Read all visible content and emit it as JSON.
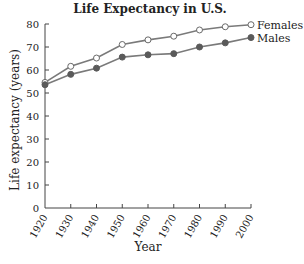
{
  "chart_data": {
    "type": "line",
    "title": "Life Expectancy in U.S.",
    "xlabel": "Year",
    "ylabel": "Life expectancy (years)",
    "x": [
      1920,
      1930,
      1940,
      1950,
      1960,
      1970,
      1980,
      1990,
      2000
    ],
    "series": [
      {
        "name": "Females",
        "marker": "hollow-circle",
        "values": [
          54.6,
          61.6,
          65.2,
          71.1,
          73.1,
          74.7,
          77.4,
          78.8,
          79.7
        ]
      },
      {
        "name": "Males",
        "marker": "filled-circle",
        "values": [
          53.6,
          58.1,
          60.8,
          65.6,
          66.6,
          67.1,
          70.0,
          71.8,
          74.1
        ]
      }
    ],
    "xlim": [
      1920,
      2000
    ],
    "ylim": [
      0,
      80
    ],
    "xticks": [
      "1920",
      "1930",
      "1940",
      "1950",
      "1960",
      "1970",
      "1980",
      "1990",
      "2000"
    ],
    "yticks": [
      "0",
      "10",
      "20",
      "30",
      "40",
      "50",
      "60",
      "70",
      "80"
    ],
    "grid": false,
    "legend_position": "inline-right",
    "xtick_rotation": -60
  },
  "colors": {
    "line": "#7a7a7a",
    "marker_filled": "#5a5a5a",
    "marker_hollow_stroke": "#6a6a6a",
    "axis": "#444444",
    "text": "#222222"
  }
}
